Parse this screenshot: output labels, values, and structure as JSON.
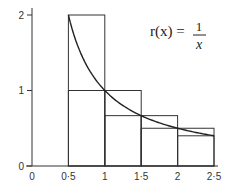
{
  "chart_data": {
    "type": "line",
    "title": "",
    "function_label": {
      "lhs": "r(x) =",
      "numerator": "1",
      "denominator": "x"
    },
    "xlabel": "",
    "ylabel": "",
    "x_ticks": [
      "0",
      "0·5",
      "1",
      "1·5",
      "2",
      "2·5"
    ],
    "y_ticks": [
      "0",
      "1",
      "2"
    ],
    "xlim": [
      0,
      2.6
    ],
    "ylim": [
      0,
      2.1
    ],
    "grid": false,
    "series": [
      {
        "name": "r(x) = 1/x",
        "type": "curve",
        "x": [
          0.5,
          0.75,
          1,
          1.25,
          1.5,
          1.75,
          2,
          2.25,
          2.5
        ],
        "y": [
          2,
          1.333,
          1,
          0.8,
          0.667,
          0.571,
          0.5,
          0.444,
          0.4
        ]
      },
      {
        "name": "upper rectangles",
        "type": "bar",
        "intervals": [
          [
            0.5,
            1
          ],
          [
            1,
            1.5
          ],
          [
            1.5,
            2
          ],
          [
            2,
            2.5
          ]
        ],
        "heights": [
          2,
          1,
          0.667,
          0.5
        ]
      },
      {
        "name": "lower rectangles",
        "type": "bar",
        "intervals": [
          [
            0.5,
            1
          ],
          [
            1,
            1.5
          ],
          [
            1.5,
            2
          ],
          [
            2,
            2.5
          ]
        ],
        "heights": [
          1,
          0.667,
          0.5,
          0.4
        ]
      }
    ]
  }
}
